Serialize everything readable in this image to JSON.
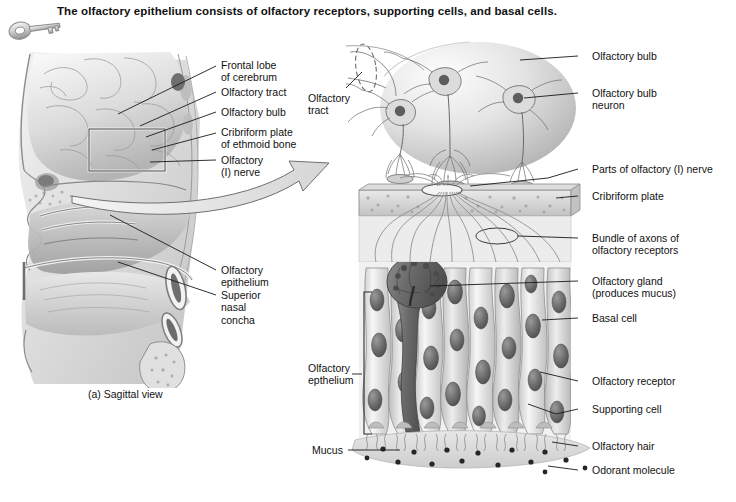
{
  "page": {
    "title": "The olfactory epithelium consists of olfactory receptors, supporting cells, and basal cells.",
    "key_icon": "key-icon"
  },
  "sagittal_view": {
    "caption": "(a) Sagittal view",
    "labels": [
      {
        "id": "frontal-lobe",
        "text": "Frontal lobe\nof cerebrum"
      },
      {
        "id": "olfactory-tract",
        "text": "Olfactory tract"
      },
      {
        "id": "olfactory-bulb",
        "text": "Olfactory bulb"
      },
      {
        "id": "cribriform-plate",
        "text": "Cribriform plate\nof ethmoid bone"
      },
      {
        "id": "olfactory-nerve",
        "text": "Olfactory\n(I) nerve"
      },
      {
        "id": "olfactory-epithelium",
        "text": "Olfactory\nepithelium"
      },
      {
        "id": "superior-nasal-concha",
        "text": "Superior\nnasal\nconcha"
      }
    ]
  },
  "magnified_view": {
    "left_labels": [
      {
        "id": "olfactory-tract",
        "text": "Olfactory\ntract"
      },
      {
        "id": "olfactory-epithelium",
        "text": "Olfactory\nepthelium"
      },
      {
        "id": "mucus",
        "text": "Mucus"
      }
    ],
    "right_labels": [
      {
        "id": "olfactory-bulb",
        "text": "Olfactory bulb"
      },
      {
        "id": "olfactory-bulb-neuron",
        "text": "Olfactory bulb\nneuron"
      },
      {
        "id": "parts-of-olfactory-nerve",
        "text": "Parts of olfactory (I) nerve"
      },
      {
        "id": "cribriform-plate",
        "text": "Cribriform plate"
      },
      {
        "id": "bundle-of-axons",
        "text": "Bundle of axons of\nolfactory receptors"
      },
      {
        "id": "olfactory-gland",
        "text": "Olfactory gland\n(produces mucus)"
      },
      {
        "id": "basal-cell",
        "text": "Basal cell"
      },
      {
        "id": "olfactory-receptor",
        "text": "Olfactory receptor"
      },
      {
        "id": "supporting-cell",
        "text": "Supporting cell"
      },
      {
        "id": "olfactory-hair",
        "text": "Olfactory hair"
      },
      {
        "id": "odorant-molecule",
        "text": "Odorant molecule"
      }
    ]
  },
  "colors": {
    "background": "#ffffff",
    "text": "#111111",
    "leader_line": "#1a1a1a",
    "tissue_light": "#e2e2e2",
    "tissue_mid": "#b9b9b9",
    "tissue_dark": "#7d7d7d",
    "nucleus": "#5e5e5e",
    "bone": "#cfcfcf",
    "gland": "#6d6d6d"
  }
}
